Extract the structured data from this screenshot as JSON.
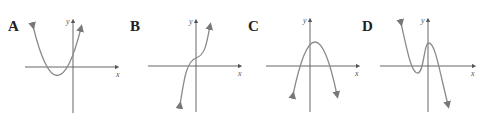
{
  "figure": {
    "panels": [
      {
        "id": "A",
        "label": "A",
        "x_axis_label": "x",
        "y_axis_label": "y",
        "description": "Upward-opening parabola, vertex below x-axis left of y-axis, two negative x-intercepts, positive y-intercept"
      },
      {
        "id": "B",
        "label": "B",
        "x_axis_label": "x",
        "y_axis_label": "y",
        "description": "Increasing cubic with inflection point just above origin"
      },
      {
        "id": "C",
        "label": "C",
        "x_axis_label": "x",
        "y_axis_label": "y",
        "description": "Downward-opening parabola, vertex above x-axis slightly right of y-axis"
      },
      {
        "id": "D",
        "label": "D",
        "x_axis_label": "x",
        "y_axis_label": "y",
        "description": "Cubic with negative leading coefficient, local min left of y-axis below x-axis, local max just right of y-axis above x-axis"
      }
    ],
    "colors": {
      "axis": "#555555",
      "curve": "#8a8a8a",
      "label": "#222222"
    }
  }
}
